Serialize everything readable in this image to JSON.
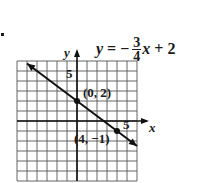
{
  "chart_data": {
    "type": "line",
    "equation": {
      "lhs": "y",
      "equals": "=",
      "sign": "−",
      "numerator": "3",
      "denominator": "4",
      "variable": "x",
      "rest": "+ 2"
    },
    "xlabel": "x",
    "ylabel": "y",
    "xlim": [
      -6,
      6
    ],
    "ylim": [
      -6,
      6
    ],
    "grid": true,
    "grid_step": 1,
    "tick_labels": {
      "x": [
        "5"
      ],
      "y": [
        "5"
      ]
    },
    "slope": -0.75,
    "intercept": 2,
    "series": [
      {
        "name": "y = -3/4 x + 2",
        "x": [
          -5,
          6
        ],
        "y": [
          5.75,
          -2.5
        ]
      }
    ],
    "points": [
      {
        "x": 0,
        "y": 2,
        "label": "(0, 2)"
      },
      {
        "x": 4,
        "y": -1,
        "label": "(4, −1)"
      }
    ]
  },
  "bullet": "•"
}
